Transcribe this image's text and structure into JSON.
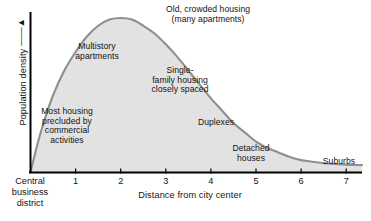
{
  "chart_data": {
    "type": "area",
    "title": "",
    "subtitle": "",
    "xlabel": "Distance from city center",
    "ylabel": "Population density",
    "ylabel_arrow": "↑",
    "xlim": [
      0,
      7.35
    ],
    "ylim": [
      0,
      1.08
    ],
    "grid": false,
    "legend": "none",
    "x_tick_labels": [
      "1",
      "2",
      "3",
      "4",
      "5",
      "6",
      "7"
    ],
    "x_tick_values": [
      1,
      2,
      3,
      4,
      5,
      6,
      7
    ],
    "y_tick_labels": [],
    "origin_label": "Central\nbusiness\ndistrict",
    "series": [
      {
        "name": "Population density",
        "x": [
          0.0,
          0.15,
          0.3,
          0.5,
          0.75,
          1.0,
          1.25,
          1.5,
          1.75,
          2.0,
          2.25,
          2.5,
          2.75,
          3.0,
          3.25,
          3.5,
          3.75,
          4.0,
          4.25,
          4.5,
          4.75,
          5.0,
          5.25,
          5.5,
          5.75,
          6.0,
          6.25,
          6.5,
          6.75,
          7.0,
          7.35
        ],
        "values": [
          0.0,
          0.18,
          0.33,
          0.5,
          0.66,
          0.78,
          0.88,
          0.95,
          0.99,
          1.0,
          0.99,
          0.95,
          0.9,
          0.83,
          0.75,
          0.66,
          0.57,
          0.48,
          0.4,
          0.32,
          0.26,
          0.2,
          0.16,
          0.13,
          0.1,
          0.08,
          0.07,
          0.06,
          0.055,
          0.05,
          0.048
        ]
      }
    ],
    "annotations": [
      {
        "id": "old-crowded",
        "text": "Old, crowded housing\n(many apartments)",
        "x": 3.2,
        "y": 1.0
      },
      {
        "id": "multistory",
        "text": "Multistory\napartments",
        "x": 1.05,
        "y": 0.78
      },
      {
        "id": "single-family",
        "text": "Single-\nfamily housing\nclosely spaced",
        "x": 2.85,
        "y": 0.62
      },
      {
        "id": "most-housing",
        "text": "Most housing\nprecluded by\ncommercial\nactivities",
        "x": 0.85,
        "y": 0.38
      },
      {
        "id": "duplexes",
        "text": "Duplexes",
        "x": 4.25,
        "y": 0.32
      },
      {
        "id": "detached",
        "text": "Detached\nhouses",
        "x": 5.15,
        "y": 0.17
      },
      {
        "id": "suburbs",
        "text": "Suburbs",
        "x": 6.85,
        "y": 0.06
      }
    ],
    "colors": {
      "fill": "#e2e2e2",
      "curve": "#8f8f8f",
      "axis": "#000000",
      "text": "#141414",
      "background": "#ffffff"
    }
  }
}
